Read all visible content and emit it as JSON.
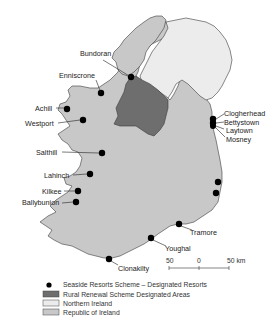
{
  "map": {
    "colors": {
      "republic": "#c8c8c8",
      "northern_ireland": "#ececec",
      "rural_renewal": "#6e6e6e",
      "coast": "#3a3a3a",
      "resort_dot": "#000000"
    },
    "resorts": [
      {
        "name": "Bundoran"
      },
      {
        "name": "Enniscrone"
      },
      {
        "name": "Achill"
      },
      {
        "name": "Westport"
      },
      {
        "name": "Salthill"
      },
      {
        "name": "Lahinch"
      },
      {
        "name": "Kilkee"
      },
      {
        "name": "Ballybunion"
      },
      {
        "name": "Clonakilty"
      },
      {
        "name": "Youghal"
      },
      {
        "name": "Tramore"
      },
      {
        "name": "Clogherhead"
      },
      {
        "name": "Bettystown"
      },
      {
        "name": "Laytown"
      },
      {
        "name": "Mosney"
      }
    ],
    "scale": {
      "left": "50",
      "center": "0",
      "right": "50 km"
    },
    "legend": [
      {
        "symbol": "dot",
        "label": "Seaside Resorts Scheme – Designated Resorts"
      },
      {
        "symbol": "dark-box",
        "label": "Rural Renewal Scheme Designated Areas"
      },
      {
        "symbol": "white-box",
        "label": "Northern Ireland"
      },
      {
        "symbol": "grey-box",
        "label": "Republic of Ireland"
      }
    ]
  }
}
